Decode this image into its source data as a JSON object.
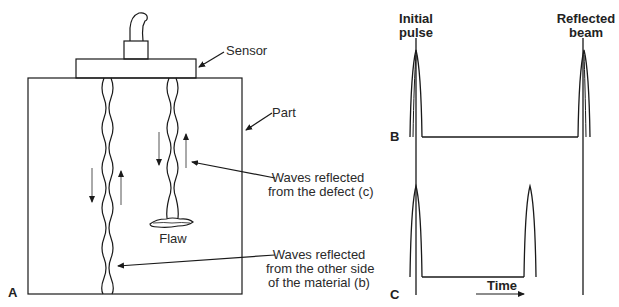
{
  "panels": {
    "a": {
      "letter": "A"
    },
    "b": {
      "letter": "B"
    },
    "c": {
      "letter": "C"
    }
  },
  "panel_a": {
    "labels": {
      "sensor": "Sensor",
      "part": "Part",
      "flaw": "Flaw",
      "defect_reflection_line1": "Waves reflected",
      "defect_reflection_line2": "from the defect (c)",
      "backwall_reflection_line1": "Waves reflected",
      "backwall_reflection_line2": "from the other side",
      "backwall_reflection_line3": "of the material (b)"
    }
  },
  "panel_b": {
    "labels": {
      "initial_pulse_line1": "Initial",
      "initial_pulse_line2": "pulse",
      "reflected_beam_line1": "Reflected",
      "reflected_beam_line2": "beam"
    }
  },
  "panel_c": {
    "labels": {
      "time_axis": "Time"
    }
  },
  "colors": {
    "line": "#1a1a1a",
    "text": "#2a2a2a",
    "background": "#ffffff"
  }
}
